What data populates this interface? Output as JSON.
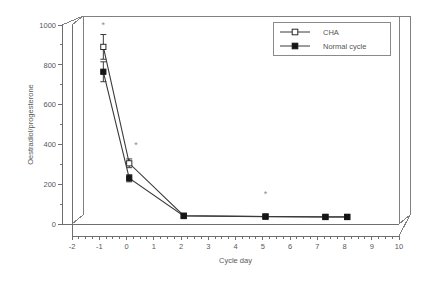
{
  "chart_data": {
    "type": "line",
    "title": "",
    "xlabel": "Cycle day",
    "ylabel": "Oestradiol/progesterone",
    "xlim": [
      -2,
      10
    ],
    "ylim": [
      0,
      1000
    ],
    "xticks": [
      "-2",
      "-1",
      "0",
      "1",
      "2",
      "3",
      "4",
      "5",
      "6",
      "7",
      "8",
      "9",
      "10"
    ],
    "yticks": [
      "0",
      "200",
      "400",
      "600",
      "800",
      "1000"
    ],
    "xminor_step": 0.25,
    "yminor_step": 100,
    "grid": false,
    "legend_position": "top-right",
    "series": [
      {
        "name": "CHA",
        "marker": "open-square",
        "x": [
          -0.85,
          0.1,
          2.1,
          5.1,
          7.3,
          8.1
        ],
        "values": [
          890,
          305,
          42,
          38,
          36,
          36
        ],
        "errors": [
          62,
          22,
          0,
          0,
          0,
          0
        ]
      },
      {
        "name": "Normal cycle",
        "marker": "filled-square",
        "x": [
          -0.85,
          0.1,
          2.1,
          5.1,
          7.3,
          8.1
        ],
        "values": [
          765,
          230,
          40,
          37,
          35,
          35
        ],
        "errors": [
          50,
          18,
          0,
          0,
          0,
          0
        ]
      }
    ],
    "annotations": [
      {
        "text": "*",
        "x": -0.85,
        "y": 1000,
        "note": "significance-marker-day-minus-1"
      },
      {
        "text": "*",
        "x": 0.35,
        "y": 395,
        "note": "significance-marker-day-0"
      },
      {
        "text": "*",
        "x": 5.1,
        "y": 150,
        "note": "significance-marker-day-5"
      }
    ],
    "colors": {
      "axis": "#6e6e6e",
      "series_line": "#3a3a3a",
      "open_marker_fill": "#ffffff",
      "filled_marker_fill": "#151515",
      "annotation": "#8d8d8d",
      "background": "#ffffff"
    }
  },
  "legend": {
    "entries": [
      {
        "label": "CHA"
      },
      {
        "label": "Normal cycle"
      }
    ]
  },
  "axes": {
    "x_title": "Cycle day",
    "y_title": "Oestradiol/progesterone"
  }
}
